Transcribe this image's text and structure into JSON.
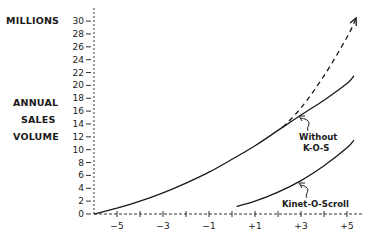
{
  "chart_data": {
    "type": "line",
    "title": "",
    "ylabel": "MILLIONS ANNUAL SALES VOLUME",
    "ylabel_lines": [
      "MILLIONS",
      "ANNUAL",
      "SALES",
      "VOLUME"
    ],
    "xlabel": "",
    "xlim": [
      -6,
      5.5
    ],
    "ylim": [
      0,
      31
    ],
    "x_ticks": [
      -5,
      -3,
      -1,
      1,
      3,
      5
    ],
    "x_tick_labels": [
      "−5",
      "−3",
      "−1",
      "+1",
      "+3",
      "+5"
    ],
    "y_ticks": [
      0,
      2,
      4,
      6,
      8,
      10,
      12,
      14,
      16,
      18,
      20,
      22,
      24,
      26,
      28,
      30
    ],
    "y_tick_labels": [
      "0",
      "2",
      "4",
      "6",
      "8",
      "10",
      "12",
      "14",
      "16",
      "18",
      "20",
      "22",
      "24",
      "26",
      "28",
      "30"
    ],
    "grid": false,
    "axes_style": "dashed",
    "series": [
      {
        "name": "Without K-O-S",
        "style": "solid",
        "x": [
          -6,
          -5,
          -4,
          -3,
          -2,
          -1,
          0,
          1,
          2,
          3,
          4,
          5,
          5.3
        ],
        "values": [
          0,
          0.9,
          2.0,
          3.3,
          4.8,
          6.5,
          8.5,
          10.6,
          13.0,
          15.4,
          17.7,
          20.3,
          21.5
        ]
      },
      {
        "name": "Projected (dashed, arrow)",
        "style": "dashed",
        "x": [
          2.2,
          3,
          4,
          5,
          5.4
        ],
        "values": [
          13.5,
          16.5,
          21.5,
          27.5,
          30.5
        ]
      },
      {
        "name": "Kinet-O-Scroll",
        "style": "solid",
        "x": [
          0.2,
          1,
          2,
          3,
          4,
          5,
          5.3
        ],
        "values": [
          1.2,
          2.0,
          3.4,
          5.2,
          7.5,
          10.3,
          11.5
        ]
      }
    ],
    "annotations": [
      {
        "text": "Without K-O-S",
        "lines": [
          "Without",
          "K-O-S"
        ],
        "points_to": "Without K-O-S curve"
      },
      {
        "text": "Kinet-O-Scroll",
        "points_to": "Kinet-O-Scroll curve"
      }
    ],
    "legend": null
  },
  "labels": {
    "millions": "MILLIONS",
    "annual": "ANNUAL",
    "sales": "SALES",
    "volume": "VOLUME",
    "without_line1": "Without",
    "without_line2": "K-O-S",
    "kinet": "Kinet-O-Scroll"
  }
}
